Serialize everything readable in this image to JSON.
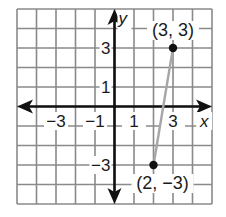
{
  "graph": {
    "grid": {
      "xmin": -5,
      "xmax": 5,
      "ymin": -5,
      "ymax": 5,
      "color": "#8a8a8a"
    },
    "axes": {
      "x_label": "x",
      "y_label": "y",
      "color": "#111111",
      "x_ticks": [
        {
          "value": -3,
          "label": "−3"
        },
        {
          "value": -1,
          "label": "−1"
        },
        {
          "value": 1,
          "label": "1"
        },
        {
          "value": 3,
          "label": "3"
        }
      ],
      "y_ticks": [
        {
          "value": 3,
          "label": "3"
        },
        {
          "value": 1,
          "label": "1"
        },
        {
          "value": -3,
          "label": "−3"
        }
      ]
    },
    "points": [
      {
        "x": 3,
        "y": 3,
        "label": "(3, 3)"
      },
      {
        "x": 2,
        "y": -3,
        "label": "(2, −3)"
      }
    ],
    "segment": {
      "from": [
        2,
        -3
      ],
      "to": [
        3,
        3
      ],
      "color": "#a6a6a6"
    }
  },
  "chart_data": {
    "type": "scatter",
    "title": "",
    "xlabel": "x",
    "ylabel": "y",
    "xlim": [
      -5,
      5
    ],
    "ylim": [
      -5,
      5
    ],
    "grid": true,
    "x_ticks": [
      -3,
      -1,
      1,
      3
    ],
    "y_ticks": [
      -3,
      1,
      3
    ],
    "series": [
      {
        "name": "segment",
        "points": [
          [
            2,
            -3
          ],
          [
            3,
            3
          ]
        ],
        "annotations": [
          "(2, −3)",
          "(3, 3)"
        ]
      }
    ]
  }
}
